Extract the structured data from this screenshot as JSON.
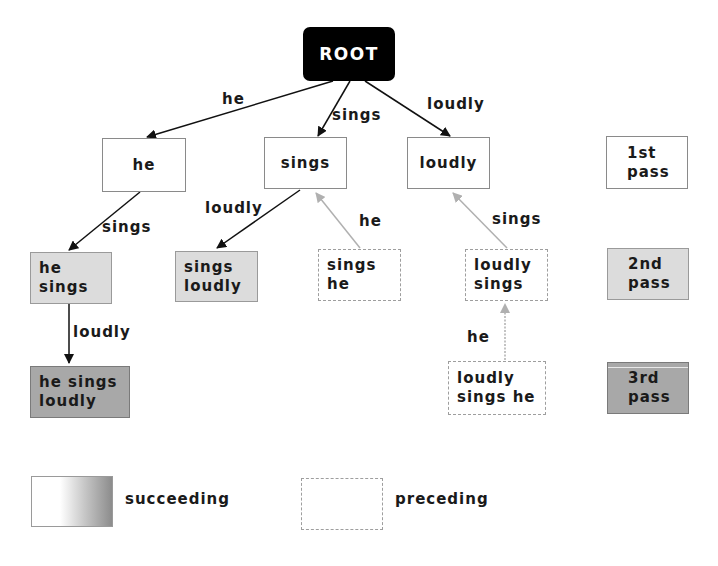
{
  "diagram": {
    "root": "ROOT",
    "level1": [
      {
        "text": "he",
        "edge": "he"
      },
      {
        "text": "sings",
        "edge": "sings"
      },
      {
        "text": "loudly",
        "edge": "loudly"
      }
    ],
    "level2": [
      {
        "line1": "he",
        "line2": "sings",
        "edge": "sings",
        "type": "succeeding"
      },
      {
        "line1": "sings",
        "line2": "loudly",
        "edge": "loudly",
        "type": "succeeding"
      },
      {
        "line1": "sings",
        "line2": "he",
        "edge": "he",
        "type": "preceding"
      },
      {
        "line1": "loudly",
        "line2": "sings",
        "edge": "sings",
        "type": "preceding"
      }
    ],
    "level3": [
      {
        "line1": "he sings",
        "line2": "loudly",
        "edge": "loudly",
        "type": "succeeding"
      },
      {
        "line1": "loudly",
        "line2": "sings he",
        "edge": "he",
        "type": "preceding"
      }
    ],
    "passes": [
      {
        "line1": "1st",
        "line2": "pass"
      },
      {
        "line1": "2nd",
        "line2": "pass"
      },
      {
        "line1": "3rd",
        "line2": "pass"
      }
    ]
  },
  "legend": {
    "succeeding": "succeeding",
    "preceding": "preceding"
  },
  "colors": {
    "root_fill": "#000000",
    "pass2_fill": "#dcdcdc",
    "pass3_fill": "#a8a8a8",
    "succeeding_edge": "#111111",
    "preceding_edge": "#b0b0b0"
  }
}
